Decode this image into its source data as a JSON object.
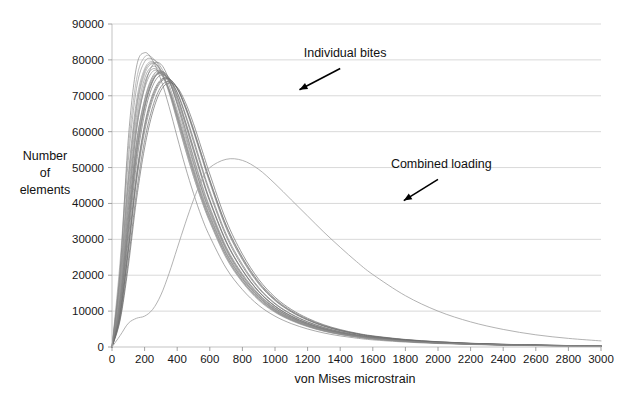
{
  "chart_data": {
    "type": "line",
    "title": "",
    "xlabel": "von Mises microstrain",
    "ylabel": "Number of elements",
    "ylabel_lines": [
      "Number",
      "of",
      "elements"
    ],
    "xlim": [
      0,
      3000
    ],
    "ylim": [
      0,
      90000
    ],
    "xticks": [
      0,
      200,
      400,
      600,
      800,
      1000,
      1200,
      1400,
      1600,
      1800,
      2000,
      2200,
      2400,
      2600,
      2800,
      3000
    ],
    "xtick_labels": [
      "0",
      "200",
      "400",
      "600",
      "800",
      "1000",
      "1200",
      "1400",
      "1600",
      "1800",
      "2000",
      "2200",
      "2400",
      "2600",
      "2800",
      "3000"
    ],
    "yticks": [
      0,
      10000,
      20000,
      30000,
      40000,
      50000,
      60000,
      70000,
      80000,
      90000
    ],
    "ytick_labels": [
      "0",
      "10000",
      "20000",
      "30000",
      "40000",
      "50000",
      "60000",
      "70000",
      "80000",
      "90000"
    ],
    "grid": true,
    "grid_axis": "y",
    "legend": "none",
    "annotations": [
      {
        "name": "individual-bites",
        "text": "Individual bites",
        "text_x": 1430,
        "text_y": 80800,
        "arrow_from_x": 1400,
        "arrow_from_y": 77600,
        "arrow_to_x": 1150,
        "arrow_to_y": 71700
      },
      {
        "name": "combined-loading",
        "text": "Combined loading",
        "text_x": 2020,
        "text_y": 49900,
        "arrow_from_x": 2000,
        "arrow_from_y": 46700,
        "arrow_to_x": 1790,
        "arrow_to_y": 40800
      }
    ],
    "x": [
      0,
      50,
      100,
      150,
      200,
      250,
      300,
      350,
      400,
      450,
      500,
      550,
      600,
      700,
      800,
      900,
      1000,
      1100,
      1200,
      1300,
      1400,
      1500,
      1600,
      1800,
      2000,
      2200,
      2400,
      2600,
      2800,
      3000
    ],
    "series": [
      {
        "name": "Individual bite 1",
        "group": "individual-bites",
        "color": "#8e8e8e",
        "values": [
          0,
          22000,
          52000,
          72000,
          79500,
          80200,
          78000,
          73000,
          66000,
          58500,
          51000,
          44000,
          38000,
          27500,
          20000,
          14500,
          10800,
          8200,
          6300,
          4900,
          3900,
          3100,
          2500,
          1700,
          1200,
          850,
          620,
          460,
          340,
          250
        ]
      },
      {
        "name": "Individual bite 2",
        "group": "individual-bites",
        "color": "#7a7a7a",
        "values": [
          0,
          14000,
          38000,
          60000,
          72500,
          78600,
          78800,
          74500,
          67500,
          59500,
          51500,
          44000,
          37500,
          27000,
          19500,
          14200,
          10500,
          8000,
          6200,
          4800,
          3800,
          3050,
          2450,
          1680,
          1180,
          840,
          610,
          450,
          335,
          245
        ]
      },
      {
        "name": "Individual bite 3",
        "group": "individual-bites",
        "color": "#6d6d6d",
        "values": [
          0,
          11000,
          32000,
          53000,
          66500,
          74000,
          76800,
          75000,
          70000,
          63000,
          55500,
          48000,
          41000,
          29500,
          21500,
          15500,
          11400,
          8600,
          6600,
          5100,
          4000,
          3200,
          2580,
          1760,
          1240,
          880,
          640,
          470,
          350,
          258
        ]
      },
      {
        "name": "Individual bite 4",
        "group": "individual-bites",
        "color": "#828282",
        "values": [
          0,
          13500,
          36000,
          57000,
          69000,
          75500,
          77000,
          74000,
          68000,
          60500,
          52500,
          45000,
          38500,
          27500,
          20000,
          14600,
          10800,
          8200,
          6300,
          4900,
          3850,
          3080,
          2480,
          1700,
          1200,
          855,
          625,
          460,
          342,
          252
        ]
      },
      {
        "name": "Individual bite 5",
        "group": "individual-bites",
        "color": "#9a9a9a",
        "values": [
          0,
          18000,
          45000,
          66000,
          76000,
          79000,
          77000,
          71500,
          64000,
          56000,
          48500,
          41500,
          35500,
          25500,
          18500,
          13500,
          10000,
          7600,
          5850,
          4550,
          3600,
          2880,
          2320,
          1600,
          1130,
          805,
          590,
          435,
          325,
          240
        ]
      },
      {
        "name": "Individual bite 6",
        "group": "individual-bites",
        "color": "#747474",
        "values": [
          0,
          9500,
          28000,
          48000,
          62000,
          70500,
          74500,
          74500,
          71000,
          65000,
          58000,
          50500,
          43500,
          31500,
          23000,
          16600,
          12200,
          9200,
          7050,
          5450,
          4280,
          3400,
          2740,
          1860,
          1300,
          925,
          670,
          495,
          366,
          270
        ]
      },
      {
        "name": "Individual bite 7",
        "group": "individual-bites",
        "color": "#888888",
        "values": [
          0,
          16000,
          41000,
          62000,
          73500,
          77500,
          76000,
          71500,
          64500,
          56800,
          49200,
          42200,
          36200,
          26000,
          18900,
          13800,
          10200,
          7750,
          5950,
          4620,
          3650,
          2920,
          2350,
          1620,
          1140,
          815,
          595,
          440,
          328,
          242
        ]
      },
      {
        "name": "Individual bite 8",
        "group": "individual-bites",
        "color": "#6a6a6a",
        "values": [
          0,
          8000,
          24000,
          43000,
          57500,
          67000,
          72500,
          74000,
          72000,
          67000,
          60500,
          53500,
          46500,
          34000,
          25000,
          18200,
          13400,
          10100,
          7750,
          5980,
          4700,
          3740,
          3010,
          2040,
          1430,
          1015,
          735,
          540,
          400,
          295
        ]
      },
      {
        "name": "Individual bite 9",
        "group": "individual-bites",
        "color": "#959595",
        "values": [
          0,
          20000,
          48000,
          68500,
          77500,
          79500,
          76800,
          70800,
          63000,
          55000,
          47500,
          40800,
          35000,
          25000,
          18200,
          13200,
          9800,
          7450,
          5750,
          4460,
          3530,
          2820,
          2270,
          1560,
          1100,
          785,
          570,
          422,
          314,
          232
        ]
      },
      {
        "name": "Individual bite 10",
        "group": "individual-bites",
        "color": "#7f7f7f",
        "values": [
          0,
          12000,
          34000,
          55000,
          67500,
          74500,
          76200,
          74200,
          69000,
          62000,
          54500,
          47200,
          40500,
          29200,
          21300,
          15400,
          11350,
          8550,
          6580,
          5080,
          4000,
          3190,
          2570,
          1750,
          1230,
          875,
          635,
          468,
          348,
          256
        ]
      },
      {
        "name": "Individual bite 11",
        "group": "individual-bites",
        "color": "#6f6f6f",
        "values": [
          0,
          10000,
          30000,
          51000,
          65000,
          72800,
          75800,
          74800,
          70800,
          64500,
          57200,
          49800,
          42800,
          30900,
          22500,
          16300,
          12000,
          9050,
          6950,
          5370,
          4220,
          3360,
          2705,
          1835,
          1285,
          913,
          662,
          488,
          362,
          266
        ]
      },
      {
        "name": "Individual bite 12",
        "group": "individual-bites",
        "color": "#8b8b8b",
        "values": [
          0,
          15000,
          39500,
          61000,
          72000,
          76800,
          76200,
          72000,
          65200,
          57500,
          50000,
          43000,
          36800,
          26400,
          19200,
          14000,
          10350,
          7870,
          6050,
          4700,
          3720,
          2980,
          2400,
          1650,
          1165,
          830,
          605,
          448,
          334,
          246
        ]
      },
      {
        "name": "Individual bite 13",
        "group": "individual-bites",
        "color": "#777777",
        "values": [
          0,
          8800,
          26500,
          46000,
          60000,
          69000,
          73800,
          74600,
          72200,
          67200,
          60800,
          53600,
          46500,
          33800,
          24700,
          17900,
          13150,
          9930,
          7610,
          5870,
          4615,
          3675,
          2955,
          2005,
          1405,
          998,
          723,
          532,
          394,
          290
        ]
      },
      {
        "name": "Individual bite 14",
        "group": "individual-bites",
        "color": "#909090",
        "values": [
          0,
          17000,
          43000,
          64000,
          74800,
          78200,
          76600,
          71800,
          64800,
          57000,
          49400,
          42400,
          36400,
          26200,
          19000,
          13900,
          10270,
          7800,
          5990,
          4650,
          3675,
          2940,
          2365,
          1630,
          1148,
          820,
          598,
          442,
          330,
          243
        ]
      },
      {
        "name": "Individual bite 15",
        "group": "individual-bites",
        "color": "#666666",
        "values": [
          0,
          7500,
          22500,
          41000,
          55500,
          65500,
          71500,
          73600,
          72400,
          68200,
          62200,
          55200,
          48200,
          35300,
          25900,
          18850,
          13880,
          10470,
          8020,
          6185,
          4860,
          3865,
          3110,
          2105,
          1475,
          1045,
          757,
          556,
          412,
          303
        ]
      },
      {
        "name": "Individual bite 16",
        "group": "individual-bites",
        "color": "#858585",
        "values": [
          0,
          13000,
          35500,
          56500,
          68500,
          75000,
          76600,
          74000,
          68200,
          60800,
          53000,
          45600,
          39000,
          28000,
          20400,
          14850,
          10970,
          8300,
          6375,
          4940,
          3900,
          3120,
          2510,
          1720,
          1210,
          862,
          628,
          464,
          345,
          254
        ]
      },
      {
        "name": "Individual bite 17",
        "group": "individual-bites",
        "color": "#9e9e9e",
        "values": [
          0,
          24000,
          55000,
          74500,
          80800,
          80500,
          77200,
          71200,
          63200,
          55200,
          47600,
          40800,
          34800,
          24800,
          18000,
          13000,
          9650,
          7330,
          5650,
          4380,
          3465,
          2765,
          2225,
          1530,
          1078,
          770,
          560,
          414,
          308,
          227
        ]
      },
      {
        "name": "Individual bite 18",
        "group": "individual-bites",
        "color": "#7c7c7c",
        "values": [
          0,
          11500,
          33000,
          54000,
          67000,
          74200,
          76500,
          74600,
          69600,
          62600,
          55000,
          47600,
          40800,
          29400,
          21400,
          15500,
          11400,
          8620,
          6615,
          5110,
          4025,
          3210,
          2585,
          1760,
          1238,
          880,
          640,
          472,
          350,
          258
        ]
      },
      {
        "name": "Individual bite 19",
        "group": "individual-bites",
        "color": "#6b6b6b",
        "values": [
          0,
          9000,
          27000,
          47000,
          61200,
          69800,
          74200,
          74800,
          72000,
          66600,
          60000,
          52800,
          45800,
          33200,
          24300,
          17600,
          12950,
          9770,
          7490,
          5780,
          4545,
          3620,
          2910,
          1975,
          1385,
          982,
          712,
          524,
          388,
          285
        ]
      },
      {
        "name": "Individual bite 20",
        "group": "individual-bites",
        "color": "#898989",
        "values": [
          0,
          19000,
          46500,
          67000,
          76800,
          79200,
          77000,
          71400,
          63800,
          56000,
          48400,
          41500,
          35500,
          25400,
          18400,
          13400,
          9930,
          7540,
          5810,
          4505,
          3565,
          2850,
          2295,
          1580,
          1115,
          795,
          580,
          428,
          318,
          235
        ]
      },
      {
        "name": "Individual bite 21",
        "group": "individual-bites",
        "color": "#818181",
        "values": [
          0,
          21500,
          58000,
          78000,
          82000,
          79800,
          74500,
          67000,
          58500,
          50200,
          42800,
          36200,
          30800,
          22000,
          16000,
          11600,
          8600,
          6520,
          5025,
          3900,
          3090,
          2470,
          1990,
          1370,
          965,
          690,
          502,
          371,
          276,
          204
        ]
      },
      {
        "name": "Combined loading",
        "group": "combined-loading",
        "color": "#a5a5a5",
        "values": [
          0,
          3200,
          6600,
          8000,
          8600,
          10500,
          14500,
          20500,
          27500,
          34500,
          41000,
          46500,
          50000,
          52300,
          52000,
          49500,
          45500,
          41000,
          36500,
          32000,
          27800,
          23800,
          20200,
          14300,
          10000,
          7000,
          4900,
          3400,
          2400,
          1700
        ]
      }
    ]
  }
}
